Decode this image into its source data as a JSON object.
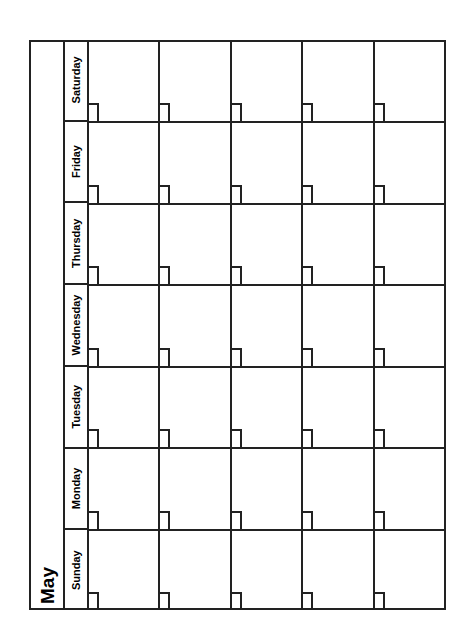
{
  "calendar": {
    "month": "May",
    "weekdays": [
      "Sunday",
      "Monday",
      "Tuesday",
      "Wednesday",
      "Thursday",
      "Friday",
      "Saturday"
    ],
    "weeks": 5,
    "orientation": "rotated-90-ccw",
    "line_color": "#222222"
  }
}
